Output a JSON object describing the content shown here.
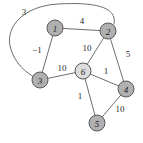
{
  "figure": {
    "type": "weighted-undirected-graph",
    "width": 143,
    "height": 143,
    "background": "#ffffff"
  },
  "style": {
    "node_fill": "#b0b0b0",
    "node_fill_highlight": "#dcdcdc",
    "node_stroke": "#5a5a5a",
    "node_radius": 8,
    "edge_stroke": "#6e6e6e",
    "edge_width": 1,
    "label_color": "#2b2b2b"
  },
  "nodes": [
    {
      "id": "1",
      "label": "1",
      "x": 55,
      "y": 28,
      "r": 8,
      "fill": "#b0b0b0"
    },
    {
      "id": "2",
      "label": "2",
      "x": 108,
      "y": 31,
      "r": 8,
      "fill": "#b0b0b0"
    },
    {
      "id": "3",
      "label": "3",
      "x": 40,
      "y": 80,
      "r": 8,
      "fill": "#b0b0b0"
    },
    {
      "id": "4",
      "label": "4",
      "x": 126,
      "y": 89,
      "r": 8,
      "fill": "#b0b0b0"
    },
    {
      "id": "5",
      "label": "5",
      "x": 97,
      "y": 123,
      "r": 8,
      "fill": "#b0b0b0"
    },
    {
      "id": "6",
      "label": "6",
      "x": 83,
      "y": 71,
      "r": 8,
      "fill": "#dcdcdc"
    }
  ],
  "edges": [
    {
      "id": "e-1-2",
      "source": "1",
      "target": "2",
      "weight": "4",
      "curved": false,
      "label_x": 82,
      "label_y": 21
    },
    {
      "id": "e-1-3",
      "source": "1",
      "target": "3",
      "weight": "−1",
      "curved": false,
      "label_x": 37,
      "label_y": 50
    },
    {
      "id": "e-2-3",
      "source": "2",
      "target": "3",
      "weight": "3",
      "curved": true,
      "label_x": 24,
      "label_y": 12,
      "path": "M 114 24 C 118 6 92 2 58 4 C 24 6 6 26 10 46 C 14 64 28 74 36 78"
    },
    {
      "id": "e-2-6",
      "source": "2",
      "target": "6",
      "weight": "10",
      "curved": false,
      "label_x": 87,
      "label_y": 48
    },
    {
      "id": "e-2-4",
      "source": "2",
      "target": "4",
      "weight": "5",
      "curved": false,
      "label_x": 128,
      "label_y": 54
    },
    {
      "id": "e-3-6",
      "source": "3",
      "target": "6",
      "weight": "10",
      "curved": false,
      "label_x": 62,
      "label_y": 68
    },
    {
      "id": "e-6-4",
      "source": "6",
      "target": "4",
      "weight": "1",
      "curved": false,
      "label_x": 106,
      "label_y": 71
    },
    {
      "id": "e-6-5",
      "source": "6",
      "target": "5",
      "weight": "1",
      "curved": false,
      "label_x": 80,
      "label_y": 96
    },
    {
      "id": "e-4-5",
      "source": "4",
      "target": "5",
      "weight": "10",
      "curved": false,
      "label_x": 120,
      "label_y": 109
    }
  ]
}
